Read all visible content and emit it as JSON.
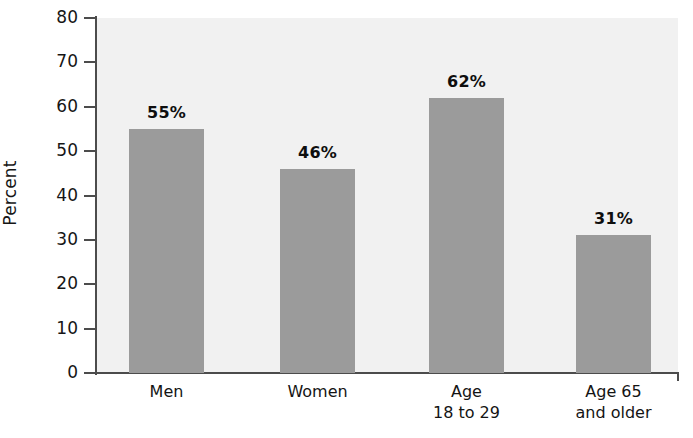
{
  "chart_data": {
    "type": "bar",
    "title": "",
    "xlabel": "",
    "ylabel": "Percent",
    "ylim": [
      0,
      80
    ],
    "grid": false,
    "legend": "none",
    "categories": [
      "Men",
      "Women",
      "Age 18 to 29",
      "Age 65 and older"
    ],
    "category_lines": [
      {
        "line1": "Men",
        "line2": ""
      },
      {
        "line1": "Women",
        "line2": ""
      },
      {
        "line1": "Age",
        "line2": "18 to 29"
      },
      {
        "line1": "Age 65",
        "line2": "and older"
      }
    ],
    "values": [
      55,
      46,
      62,
      31
    ],
    "value_labels": [
      "55%",
      "46%",
      "62%",
      "31%"
    ],
    "ytick_labels": [
      "80",
      "70",
      "60",
      "50",
      "40",
      "30",
      "20",
      "10",
      "0"
    ],
    "ytick_values": [
      80,
      70,
      60,
      50,
      40,
      30,
      20,
      10,
      0
    ],
    "colors": {
      "bar": "#9b9b9b",
      "plot_background": "#f1f1f1",
      "axis": "#4c4c4c",
      "text": "#141414",
      "page_background": "#ffffff"
    }
  }
}
